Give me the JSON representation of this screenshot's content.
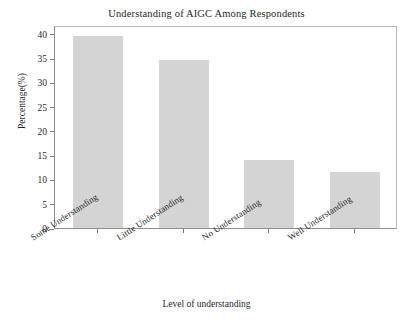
{
  "chart_data": {
    "type": "bar",
    "title": "Understanding of AIGC Among Respondents",
    "xlabel": "Level of understanding",
    "ylabel": "Percentage(%)",
    "categories": [
      "Some Understanding",
      "Little Understanding",
      "No Understanding",
      "Well Understanding"
    ],
    "values": [
      39.5,
      34.5,
      14.0,
      11.5
    ],
    "ylim": [
      0,
      41.8
    ],
    "yticks": [
      0,
      5,
      10,
      15,
      20,
      25,
      30,
      35,
      40
    ],
    "ytick_labels": [
      "0",
      "5",
      "10",
      "15",
      "20",
      "25",
      "30",
      "35",
      "40"
    ],
    "grid": false,
    "legend": "none",
    "bar_color": "#d4d4d4",
    "axis_color": "#8f8f8f",
    "text_color": "#1f1f1f"
  }
}
